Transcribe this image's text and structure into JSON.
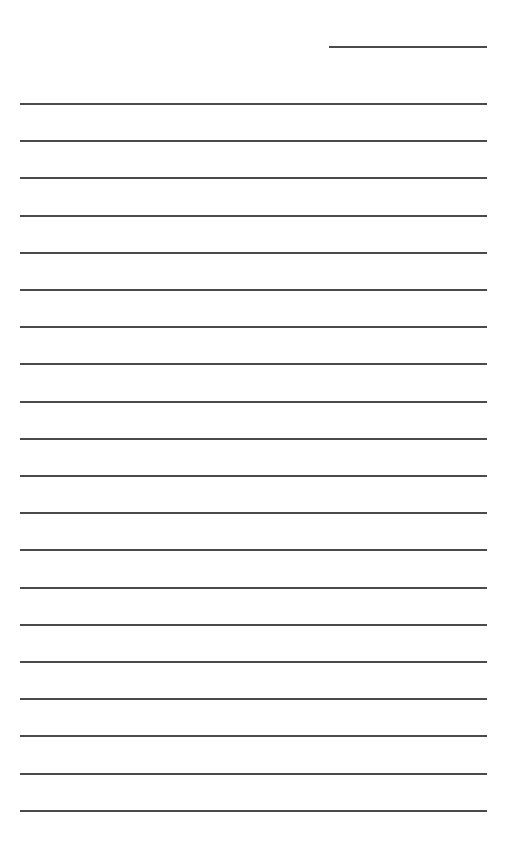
{
  "document": {
    "type": "blank lined form",
    "colors": {
      "line": "#4a4a4a",
      "background": "#ffffff"
    },
    "header_line": {
      "x": 329,
      "y": 46,
      "width": 158
    },
    "lines": {
      "count": 20,
      "start_y": 103,
      "spacing": 37.2,
      "left_x": 20,
      "split_x": 346,
      "right_x": 487
    }
  }
}
